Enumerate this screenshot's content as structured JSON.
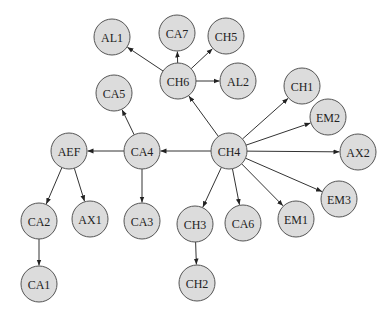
{
  "diagram": {
    "type": "directed-tree",
    "nodes": [
      {
        "id": "CH4",
        "label": "CH4"
      },
      {
        "id": "CH6",
        "label": "CH6"
      },
      {
        "id": "AL1",
        "label": "AL1"
      },
      {
        "id": "CA7",
        "label": "CA7"
      },
      {
        "id": "CH5",
        "label": "CH5"
      },
      {
        "id": "AL2",
        "label": "AL2"
      },
      {
        "id": "CH1",
        "label": "CH1"
      },
      {
        "id": "EM2",
        "label": "EM2"
      },
      {
        "id": "AX2",
        "label": "AX2"
      },
      {
        "id": "EM3",
        "label": "EM3"
      },
      {
        "id": "EM1",
        "label": "EM1"
      },
      {
        "id": "CA6",
        "label": "CA6"
      },
      {
        "id": "CH3",
        "label": "CH3"
      },
      {
        "id": "CH2",
        "label": "CH2"
      },
      {
        "id": "CA4",
        "label": "CA4"
      },
      {
        "id": "CA5",
        "label": "CA5"
      },
      {
        "id": "CA3",
        "label": "CA3"
      },
      {
        "id": "AEF",
        "label": "AEF"
      },
      {
        "id": "CA2",
        "label": "CA2"
      },
      {
        "id": "CA1",
        "label": "CA1"
      },
      {
        "id": "AX1",
        "label": "AX1"
      }
    ],
    "edges": [
      {
        "from": "CH4",
        "to": "CH6"
      },
      {
        "from": "CH6",
        "to": "AL1"
      },
      {
        "from": "CH6",
        "to": "CA7"
      },
      {
        "from": "CH6",
        "to": "CH5"
      },
      {
        "from": "CH6",
        "to": "AL2"
      },
      {
        "from": "CH4",
        "to": "CH1"
      },
      {
        "from": "CH4",
        "to": "EM2"
      },
      {
        "from": "CH4",
        "to": "AX2"
      },
      {
        "from": "CH4",
        "to": "EM3"
      },
      {
        "from": "CH4",
        "to": "EM1"
      },
      {
        "from": "CH4",
        "to": "CA6"
      },
      {
        "from": "CH4",
        "to": "CH3"
      },
      {
        "from": "CH3",
        "to": "CH2"
      },
      {
        "from": "CH4",
        "to": "CA4"
      },
      {
        "from": "CA4",
        "to": "CA5"
      },
      {
        "from": "CA4",
        "to": "CA3"
      },
      {
        "from": "CA4",
        "to": "AEF"
      },
      {
        "from": "AEF",
        "to": "CA2"
      },
      {
        "from": "AEF",
        "to": "AX1"
      },
      {
        "from": "CA2",
        "to": "CA1"
      }
    ],
    "colors": {
      "node_fill": "#dcdcdc",
      "node_stroke": "#555555",
      "edge": "#333333"
    }
  }
}
